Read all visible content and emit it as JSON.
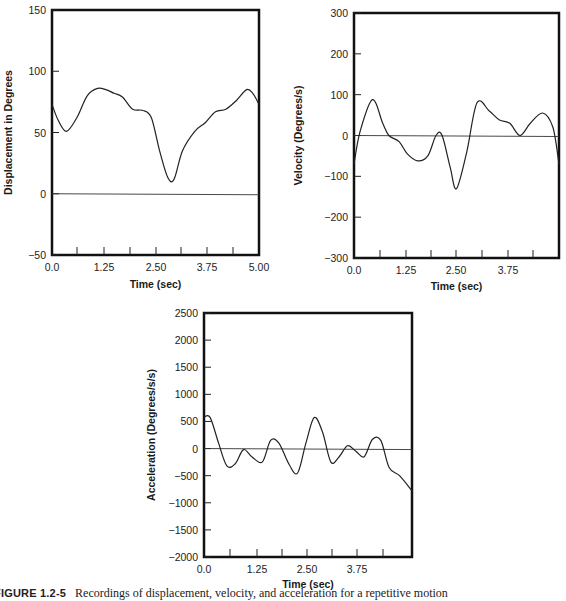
{
  "caption": {
    "label": "FIGURE 1.2-5",
    "text": "Recordings of displacement, velocity, and acceleration for a repetitive motion"
  },
  "chart_data": [
    {
      "type": "line",
      "title": "",
      "xlabel": "Time (sec)",
      "ylabel": "Displacement in Degrees",
      "xlim": [
        0,
        5.0
      ],
      "ylim": [
        -50,
        150
      ],
      "x_ticks": [
        "0.0",
        "1.25",
        "2.50",
        "3.75",
        "5.00"
      ],
      "y_ticks": [
        "150",
        "100",
        "50",
        "0",
        "−50"
      ],
      "grid": false,
      "zero_line": true,
      "x": [
        0.0,
        0.15,
        0.35,
        0.6,
        0.85,
        1.1,
        1.3,
        1.5,
        1.7,
        1.95,
        2.2,
        2.4,
        2.6,
        2.8,
        2.95,
        3.15,
        3.45,
        3.7,
        3.95,
        4.2,
        4.45,
        4.7,
        4.85,
        5.0
      ],
      "values": [
        73,
        60,
        51,
        62,
        80,
        86,
        85,
        82,
        79,
        69,
        68,
        62,
        35,
        13,
        12,
        35,
        51,
        58,
        67,
        69,
        76,
        85,
        82,
        73
      ]
    },
    {
      "type": "line",
      "title": "",
      "xlabel": "Time (sec)",
      "ylabel": "Velocity (Degrees/s)",
      "xlim": [
        0,
        5.0
      ],
      "ylim": [
        -300,
        300
      ],
      "x_ticks": [
        "0.0",
        "1.25",
        "2.50",
        "3.75"
      ],
      "y_ticks": [
        "300",
        "200",
        "100",
        "0",
        "−100",
        "−200",
        "−300"
      ],
      "grid": false,
      "zero_line": true,
      "x": [
        0.0,
        0.15,
        0.45,
        0.7,
        0.85,
        1.1,
        1.3,
        1.55,
        1.8,
        2.0,
        2.15,
        2.35,
        2.5,
        2.75,
        3.0,
        3.3,
        3.55,
        3.8,
        4.05,
        4.3,
        4.6,
        4.85,
        5.0
      ],
      "values": [
        -70,
        10,
        88,
        30,
        0,
        -15,
        -45,
        -62,
        -50,
        0,
        0,
        -80,
        -130,
        -40,
        80,
        60,
        38,
        30,
        0,
        30,
        55,
        20,
        -70
      ]
    },
    {
      "type": "line",
      "title": "",
      "xlabel": "Time (sec)",
      "ylabel": "Acceleration (Degrees/s/s)",
      "xlim": [
        0,
        5.0
      ],
      "ylim": [
        -2000,
        2500
      ],
      "x_ticks": [
        "0.0",
        "1.25",
        "2.50",
        "3.75"
      ],
      "y_ticks": [
        "2500",
        "2000",
        "1500",
        "1000",
        "500",
        "0",
        "−500",
        "−1000",
        "−1500",
        "−2000"
      ],
      "grid": false,
      "zero_line": true,
      "x": [
        0.0,
        0.15,
        0.35,
        0.55,
        0.75,
        0.95,
        1.15,
        1.4,
        1.6,
        1.8,
        2.05,
        2.25,
        2.45,
        2.65,
        2.85,
        3.05,
        3.25,
        3.45,
        3.65,
        3.85,
        4.05,
        4.25,
        4.45,
        4.7,
        5.0
      ],
      "values": [
        580,
        570,
        100,
        -320,
        -280,
        -20,
        -150,
        -250,
        150,
        100,
        -300,
        -450,
        100,
        570,
        300,
        -250,
        -150,
        50,
        -50,
        -150,
        170,
        150,
        -350,
        -500,
        -780
      ]
    }
  ]
}
